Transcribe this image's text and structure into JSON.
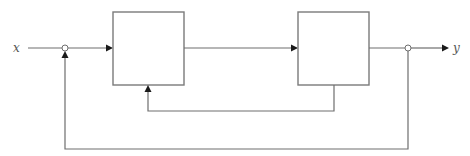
{
  "diagram": {
    "type": "block-diagram",
    "input_label": "x",
    "output_label": "y",
    "colors": {
      "line": "#6e6e6e",
      "block_border": "#7a7a7a",
      "arrowhead": "#1a1a1a",
      "label": "#555555",
      "background": "#ffffff"
    },
    "blocks": [
      {
        "id": "block-1",
        "label": ""
      },
      {
        "id": "block-2",
        "label": ""
      }
    ],
    "junctions": [
      {
        "id": "summing-junction",
        "role": "sum"
      },
      {
        "id": "takeoff-point",
        "role": "branch"
      }
    ],
    "connections": [
      {
        "from": "x",
        "to": "summing-junction"
      },
      {
        "from": "summing-junction",
        "to": "block-1"
      },
      {
        "from": "block-1",
        "to": "block-2"
      },
      {
        "from": "block-2",
        "to": "takeoff-point"
      },
      {
        "from": "takeoff-point",
        "to": "y"
      },
      {
        "from": "block-2",
        "to": "block-1",
        "kind": "inner-feedback"
      },
      {
        "from": "takeoff-point",
        "to": "summing-junction",
        "kind": "outer-feedback"
      }
    ]
  }
}
